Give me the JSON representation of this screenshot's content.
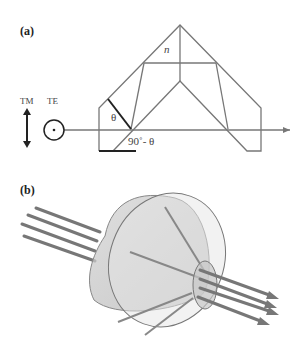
{
  "panel_a": {
    "label": "(a)",
    "polarization": {
      "tm_label": "TM",
      "te_label": "TE"
    },
    "prism_index_label": "n",
    "angle_theta": "θ",
    "angle_complement": "90˚- θ"
  },
  "panel_b": {
    "label": "(b)"
  },
  "colors": {
    "line": "#777777",
    "dark": "#222222",
    "cone": "#bcbcbc"
  }
}
